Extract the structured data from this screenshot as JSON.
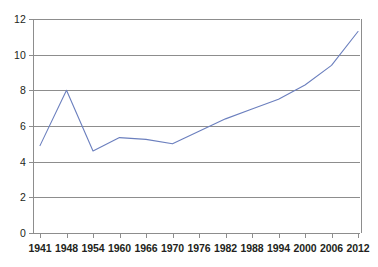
{
  "chart_data": {
    "type": "line",
    "title": "",
    "subtitle": "",
    "xlabel": "",
    "ylabel": "",
    "categories": [
      "1941",
      "1948",
      "1954",
      "1960",
      "1966",
      "1970",
      "1976",
      "1982",
      "1988",
      "1994",
      "2000",
      "2006",
      "2012"
    ],
    "values": [
      4.9,
      8.0,
      4.6,
      5.35,
      5.25,
      5.0,
      5.7,
      6.4,
      6.95,
      7.5,
      8.3,
      9.4,
      11.3
    ],
    "series": [
      {
        "name": "series-1",
        "color": "#6b7fbe",
        "values": [
          4.9,
          8.0,
          4.6,
          5.35,
          5.25,
          5.0,
          5.7,
          6.4,
          6.95,
          7.5,
          8.3,
          9.4,
          11.3
        ]
      }
    ],
    "ylim": [
      0,
      12
    ],
    "y_ticks": [
      "0",
      "2",
      "4",
      "6",
      "8",
      "10",
      "12"
    ],
    "y_tick_values": [
      0,
      2,
      4,
      6,
      8,
      10,
      12
    ],
    "x_ticks": [
      "1941",
      "1948",
      "1954",
      "1960",
      "1966",
      "1970",
      "1976",
      "1982",
      "1988",
      "1994",
      "2000",
      "2006",
      "2012"
    ],
    "grid": true,
    "grid_axis": "y",
    "legend": false,
    "legend_position": "none",
    "annotations": [],
    "colors": {
      "line": "#6b7fbe",
      "axis": "#8d8d8d",
      "grid": "#8d8d8d",
      "text": "#231f20",
      "background": "#ffffff"
    }
  },
  "figure": {
    "background": "#ffffff",
    "plot_background": "#ffffff"
  }
}
